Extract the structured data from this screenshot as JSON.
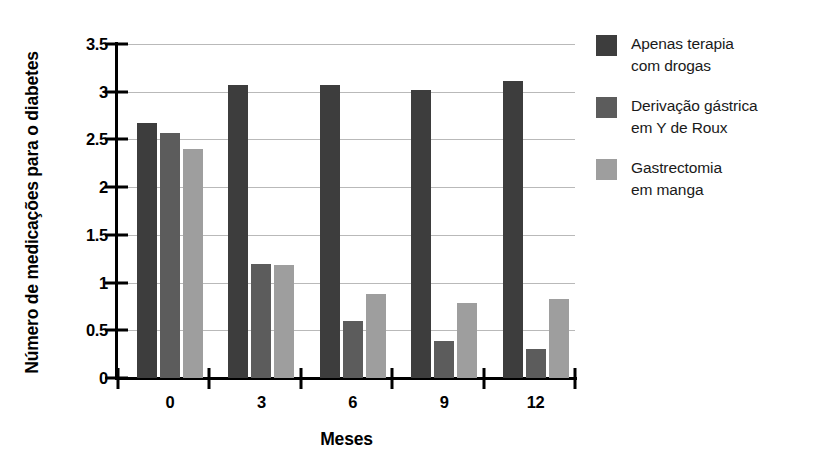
{
  "chart_data": {
    "type": "bar",
    "title": "",
    "xlabel": "Meses",
    "ylabel": "Número de medicações para o diabetes",
    "categories": [
      "0",
      "3",
      "6",
      "9",
      "12"
    ],
    "ylim": [
      0,
      3.5
    ],
    "yticks": [
      "0",
      "0.5",
      "1",
      "1.5",
      "2",
      "2.5",
      "3",
      "3.5"
    ],
    "ytick_values": [
      0,
      0.5,
      1,
      1.5,
      2,
      2.5,
      3,
      3.5
    ],
    "grid": true,
    "legend_position": "right",
    "series": [
      {
        "name": "Apenas terapia com drogas",
        "color": "#3d3d3d",
        "values": [
          2.67,
          3.07,
          3.07,
          3.02,
          3.11
        ]
      },
      {
        "name": "Derivação gástrica em Y de Roux",
        "color": "#5c5c5c",
        "values": [
          2.57,
          1.19,
          0.6,
          0.39,
          0.3
        ]
      },
      {
        "name": "Gastrectomia em manga",
        "color": "#9e9e9e",
        "values": [
          2.4,
          1.18,
          0.88,
          0.79,
          0.83
        ]
      }
    ]
  },
  "legend": {
    "entries": [
      {
        "label": "Apenas terapia\ncom drogas",
        "color": "#3d3d3d"
      },
      {
        "label": "Derivação gástrica\nem Y de Roux",
        "color": "#5c5c5c"
      },
      {
        "label": "Gastrectomia\nem manga",
        "color": "#9e9e9e"
      }
    ]
  },
  "axes": {
    "x_title": "Meses",
    "y_title": "Número de medicações para o diabetes"
  }
}
